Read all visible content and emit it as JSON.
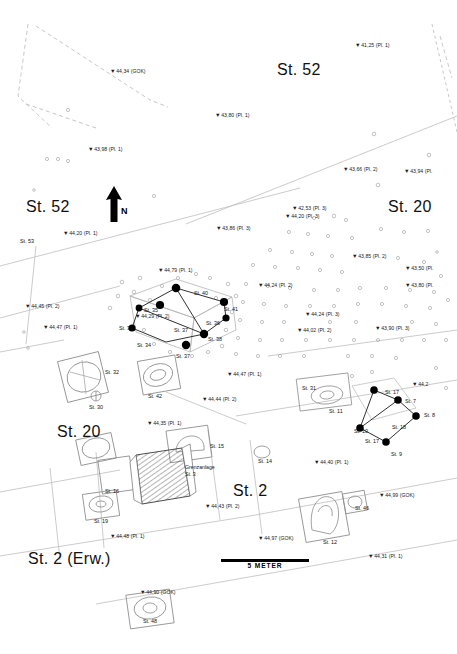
{
  "map": {
    "type": "archaeological-site-plan",
    "language": "de",
    "background_color": "#ffffff",
    "ink_color": "#111111",
    "width": 457,
    "height": 654
  },
  "north_arrow": {
    "label": "N"
  },
  "scale_bar": {
    "label": "5 METER",
    "length_m": 5
  },
  "area_labels": [
    {
      "text": "St. 52",
      "x": 277,
      "y": 61
    },
    {
      "text": "St. 52",
      "x": 26,
      "y": 198
    },
    {
      "text": "St. 20",
      "x": 388,
      "y": 198
    },
    {
      "text": "St. 20",
      "x": 57,
      "y": 423
    },
    {
      "text": "St. 2",
      "x": 233,
      "y": 482
    },
    {
      "text": "St. 2 (Erw.)",
      "x": 28,
      "y": 550
    }
  ],
  "annotations": [
    {
      "text": "Grenzanlage",
      "x": 185,
      "y": 464
    },
    {
      "text": "St. 3",
      "x": 185,
      "y": 471
    }
  ],
  "elevation_points": [
    {
      "label": "41,25 (Pl. 1)",
      "x": 355,
      "y": 42
    },
    {
      "label": "44,34 (GOK)",
      "x": 110,
      "y": 68
    },
    {
      "label": "43,80 (Pl. 1)",
      "x": 215,
      "y": 112
    },
    {
      "label": "43,98 (Pl. 1)",
      "x": 88,
      "y": 146
    },
    {
      "label": "43,66 (Pl. 2)",
      "x": 343,
      "y": 166
    },
    {
      "label": "43,94 (Pl.",
      "x": 404,
      "y": 168
    },
    {
      "label": "42,53 (Pl. 3)",
      "x": 292,
      "y": 205
    },
    {
      "label": "44,20 (Pl. 3)",
      "x": 285,
      "y": 213
    },
    {
      "label": "44,20 (Pl. 1)",
      "x": 63,
      "y": 230
    },
    {
      "label": "43,86 (Pl. 3)",
      "x": 216,
      "y": 225
    },
    {
      "label": "43,85 (Pl. 2)",
      "x": 352,
      "y": 253
    },
    {
      "label": "43,50 (Pl.",
      "x": 405,
      "y": 265
    },
    {
      "label": "43,80 (Pl.",
      "x": 405,
      "y": 282
    },
    {
      "label": "44,79 (Pl. 1)",
      "x": 158,
      "y": 267
    },
    {
      "label": "44,45 (Pl. 2)",
      "x": 25,
      "y": 303
    },
    {
      "label": "44,24 (Pl. 2)",
      "x": 258,
      "y": 282
    },
    {
      "label": "44,24 (Pl. 3)",
      "x": 305,
      "y": 311
    },
    {
      "label": "44,02 (Pl. 2)",
      "x": 297,
      "y": 327
    },
    {
      "label": "43,90 (Pl. 3)",
      "x": 375,
      "y": 325
    },
    {
      "label": "44,47 (Pl. 1)",
      "x": 43,
      "y": 324
    },
    {
      "label": "44,29 (Pl. 2)",
      "x": 135,
      "y": 313
    },
    {
      "label": "44,47 (Pl. 1)",
      "x": 227,
      "y": 371
    },
    {
      "label": "44,44 (Pl. 2)",
      "x": 202,
      "y": 396
    },
    {
      "label": "44,2",
      "x": 412,
      "y": 381
    },
    {
      "label": "44,35 (Pl. 1)",
      "x": 147,
      "y": 420
    },
    {
      "label": "44,40 (Pl. 1)",
      "x": 314,
      "y": 459
    },
    {
      "label": "44,43 (Pl. 2)",
      "x": 205,
      "y": 503
    },
    {
      "label": "44,99 (GOK)",
      "x": 379,
      "y": 492
    },
    {
      "label": "44,97 (GOK)",
      "x": 258,
      "y": 535
    },
    {
      "label": "44,31 (Pl. 1)",
      "x": 368,
      "y": 553
    },
    {
      "label": "44,48 (Pl. 1)",
      "x": 110,
      "y": 533
    },
    {
      "label": "44,90 (GOK)",
      "x": 140,
      "y": 589
    }
  ],
  "features": [
    {
      "label": "St. 53",
      "x": 20,
      "y": 238
    },
    {
      "label": "St. 40",
      "x": 194,
      "y": 290
    },
    {
      "label": "St. 41",
      "x": 224,
      "y": 306
    },
    {
      "label": "St. 35",
      "x": 144,
      "y": 307
    },
    {
      "label": "St. 36",
      "x": 206,
      "y": 320
    },
    {
      "label": "St. 37",
      "x": 174,
      "y": 327
    },
    {
      "label": "St. 38",
      "x": 208,
      "y": 336
    },
    {
      "label": "St. 39",
      "x": 119,
      "y": 325
    },
    {
      "label": "St. 34",
      "x": 137,
      "y": 342
    },
    {
      "label": "St. 37",
      "x": 176,
      "y": 353
    },
    {
      "label": "St. 32",
      "x": 105,
      "y": 369
    },
    {
      "label": "St. 42",
      "x": 148,
      "y": 393
    },
    {
      "label": "St. 30",
      "x": 89,
      "y": 404
    },
    {
      "label": "St. 31",
      "x": 302,
      "y": 385
    },
    {
      "label": "St. 11",
      "x": 329,
      "y": 408
    },
    {
      "label": "St. 17",
      "x": 385,
      "y": 389
    },
    {
      "label": "St. 7",
      "x": 405,
      "y": 398
    },
    {
      "label": "St. 8",
      "x": 424,
      "y": 412
    },
    {
      "label": "St. 18",
      "x": 392,
      "y": 424
    },
    {
      "label": "St. 10",
      "x": 354,
      "y": 428
    },
    {
      "label": "St. 17",
      "x": 365,
      "y": 438
    },
    {
      "label": "St. 9",
      "x": 391,
      "y": 451
    },
    {
      "label": "St. 15",
      "x": 210,
      "y": 443
    },
    {
      "label": "St. 14",
      "x": 258,
      "y": 458
    },
    {
      "label": "St. 16",
      "x": 105,
      "y": 488
    },
    {
      "label": "St. 46",
      "x": 355,
      "y": 505
    },
    {
      "label": "St. 19",
      "x": 94,
      "y": 518
    },
    {
      "label": "St. 12",
      "x": 323,
      "y": 539
    },
    {
      "label": "St. 48",
      "x": 143,
      "y": 618
    }
  ]
}
